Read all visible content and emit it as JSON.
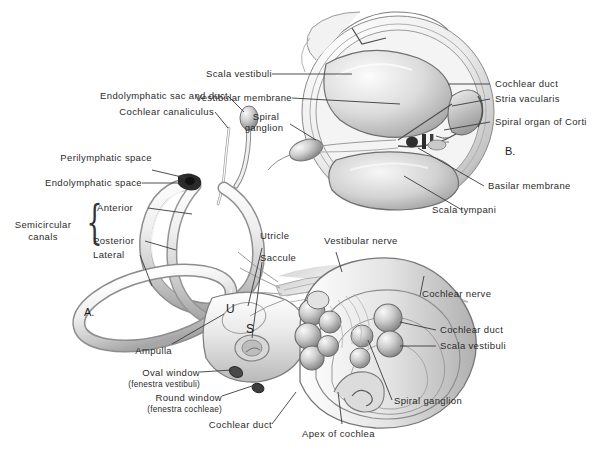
{
  "figure": {
    "background": "#ffffff",
    "text_color": "#2b2b2b",
    "leader_color": "#3a3a3a"
  },
  "panels": [
    {
      "id": "A",
      "label": "A.",
      "description": "Bony and membranous labyrinth with semicircular canals, vestibule and cochlea"
    },
    {
      "id": "B",
      "label": "B.",
      "description": "Cross section through one turn of the cochlear canal"
    }
  ],
  "labels": {
    "panel_b": [
      {
        "name": "scala-vestibuli",
        "text": "Scala vestibuli"
      },
      {
        "name": "vestibular-membrane",
        "text": "Vestibular membrane"
      },
      {
        "name": "spiral-ganglion-b",
        "text": "Spiral\nganglion",
        "line1": "Spiral",
        "line2": "ganglion"
      },
      {
        "name": "cochlear-duct-b",
        "text": "Cochlear duct"
      },
      {
        "name": "stria-vascularis",
        "text": "Stria vacularis"
      },
      {
        "name": "spiral-organ-of-corti",
        "text": "Spiral organ of Corti"
      },
      {
        "name": "basilar-membrane",
        "text": "Basilar membrane"
      },
      {
        "name": "scala-tympani",
        "text": "Scala tympani"
      }
    ],
    "panel_a": [
      {
        "name": "endolymphatic-sac-and-duct",
        "text": "Endolymphatic sac and duct"
      },
      {
        "name": "cochlear-canaliculus",
        "text": "Cochlear canaliculus"
      },
      {
        "name": "perilymphatic-space",
        "text": "Perilymphatic space"
      },
      {
        "name": "endolymphatic-space",
        "text": "Endolymphatic space"
      },
      {
        "name": "semicircular-canals-group",
        "line1": "Semicircular",
        "line2": "canals"
      },
      {
        "name": "anterior-canal",
        "text": "Anterior"
      },
      {
        "name": "posterior-canal",
        "text": "Posterior"
      },
      {
        "name": "lateral-canal",
        "text": "Lateral"
      },
      {
        "name": "utricle",
        "text": "Utricle"
      },
      {
        "name": "saccule",
        "text": "Saccule"
      },
      {
        "name": "vestibular-nerve",
        "text": "Vestibular nerve"
      },
      {
        "name": "cochlear-nerve",
        "text": "Cochlear nerve"
      },
      {
        "name": "cochlear-duct-a-right",
        "text": "Cochlear duct"
      },
      {
        "name": "scala-vestibuli-a",
        "text": "Scala vestibuli"
      },
      {
        "name": "spiral-ganglion-a",
        "text": "Spiral ganglion"
      },
      {
        "name": "apex-of-cochlea",
        "text": "Apex of cochlea"
      },
      {
        "name": "ampulla",
        "text": "Ampulla"
      },
      {
        "name": "oval-window",
        "text": "Oval window"
      },
      {
        "name": "oval-window-latin",
        "text": "(fenestra vestibuli)"
      },
      {
        "name": "round-window",
        "text": "Round window"
      },
      {
        "name": "round-window-latin",
        "text": "(fenestra cochleae)"
      },
      {
        "name": "cochlear-duct-a-bottom",
        "text": "Cochlear duct"
      }
    ],
    "markers": [
      {
        "name": "utricle-marker",
        "text": "U"
      },
      {
        "name": "saccule-marker",
        "text": "S"
      }
    ]
  }
}
